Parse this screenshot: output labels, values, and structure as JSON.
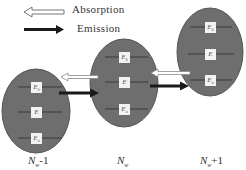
{
  "legend": {
    "absorption_label": "Absorption",
    "emission_label": "Emission"
  },
  "dots": [
    {
      "label_main": "N",
      "label_sub": "w",
      "label_suffix": "-1",
      "levels": [
        {
          "sym": "E",
          "sub": "b"
        },
        {
          "sym": "E",
          "sub": ""
        },
        {
          "sym": "E",
          "sub": "a"
        }
      ]
    },
    {
      "label_main": "N",
      "label_sub": "w",
      "label_suffix": "",
      "levels": [
        {
          "sym": "E",
          "sub": "b"
        },
        {
          "sym": "E",
          "sub": ""
        },
        {
          "sym": "E",
          "sub": "a"
        }
      ]
    },
    {
      "label_main": "N",
      "label_sub": "w",
      "label_suffix": "+1",
      "levels": [
        {
          "sym": "E",
          "sub": "b"
        },
        {
          "sym": "E",
          "sub": ""
        },
        {
          "sym": "E",
          "sub": "a"
        }
      ]
    }
  ],
  "colors": {
    "dot_fill": "#6e6e6e",
    "dot_stroke": "#555555",
    "level_line": "#3a3a3a",
    "emission_arrow": "#1a1a1a",
    "absorption_arrow_stroke": "#888888"
  }
}
